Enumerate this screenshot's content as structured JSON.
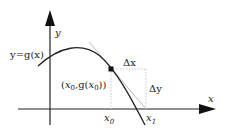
{
  "diagram": {
    "type": "newton-method-tangent",
    "axes": {
      "x_label": "x",
      "y_label": "y"
    },
    "curve_label": "y=g(x)",
    "point_label": "(x0,g(x0))",
    "point_label_parts": {
      "open": "(",
      "x": "x",
      "x_sub": "0",
      "sep": ",g(",
      "x2": "x",
      "x2_sub": "0",
      "close": "))"
    },
    "delta_x_label": "Δx",
    "delta_y_label": "Δy",
    "x0_label": {
      "base": "x",
      "sub": "0"
    },
    "x1_label": {
      "base": "x",
      "sub": "1"
    },
    "colors": {
      "axis": "#222222",
      "curve": "#222222",
      "tangent": "#bbbbbb",
      "dotted": "#bbbbbb",
      "point": "#111111"
    }
  }
}
